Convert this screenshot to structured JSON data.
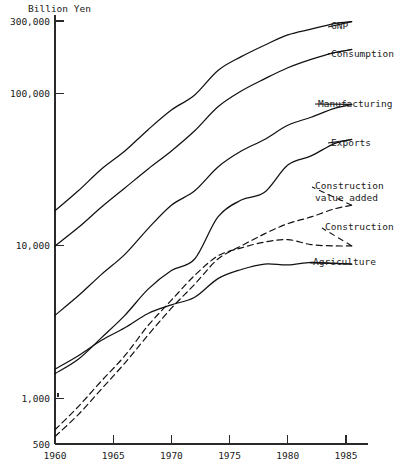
{
  "chart_data": {
    "type": "line",
    "title": "",
    "unit_label": "Billion Yen",
    "xlabel": "",
    "ylabel": "Billion Yen",
    "yscale": "log",
    "ylim": [
      500,
      300000
    ],
    "xlim": [
      1960,
      1985.7
    ],
    "grid": false,
    "legend_position": "right-inline-labels",
    "ytick_labels": [
      "300,000",
      "100,000",
      "10,000",
      "1,000",
      "500"
    ],
    "ytick_values": [
      300000,
      100000,
      10000,
      1000,
      500
    ],
    "xtick_labels": [
      "1960",
      "1965",
      "1970",
      "1975",
      "1980",
      "1985"
    ],
    "xtick_values": [
      1960,
      1965,
      1970,
      1975,
      1980,
      1985
    ],
    "series": [
      {
        "name": "GNP",
        "style": "solid",
        "label": "GNP",
        "x": [
          1960,
          1962,
          1964,
          1966,
          1968,
          1970,
          1972,
          1974,
          1976,
          1978,
          1980,
          1982,
          1984,
          1985.5
        ],
        "values": [
          17000,
          23000,
          32000,
          42000,
          58000,
          78000,
          98000,
          142000,
          175000,
          208000,
          243000,
          265000,
          288000,
          297000
        ]
      },
      {
        "name": "Consumption",
        "style": "solid",
        "label": "Consumption",
        "x": [
          1960,
          1962,
          1964,
          1966,
          1968,
          1970,
          1972,
          1974,
          1976,
          1978,
          1980,
          1982,
          1984,
          1985.5
        ],
        "values": [
          10000,
          13200,
          18000,
          24000,
          32000,
          42000,
          57000,
          82000,
          104000,
          125000,
          148000,
          168000,
          186000,
          195000
        ]
      },
      {
        "name": "Manufacturing",
        "style": "solid",
        "label": "Manufacturing",
        "x": [
          1960,
          1962,
          1964,
          1966,
          1968,
          1970,
          1972,
          1974,
          1976,
          1978,
          1980,
          1982,
          1984,
          1985.5
        ],
        "values": [
          3500,
          4700,
          6500,
          8800,
          13000,
          18500,
          23000,
          33000,
          42000,
          50000,
          62000,
          70000,
          80000,
          85000
        ]
      },
      {
        "name": "Exports",
        "style": "solid",
        "label": "Exports",
        "x": [
          1960,
          1962,
          1964,
          1966,
          1968,
          1970,
          1972,
          1974,
          1976,
          1978,
          1980,
          1982,
          1984,
          1985.5
        ],
        "values": [
          1450,
          1800,
          2500,
          3500,
          5200,
          6900,
          8200,
          15500,
          20000,
          22500,
          34000,
          39000,
          47000,
          50000
        ]
      },
      {
        "name": "Construction value added",
        "style": "dashed",
        "label": "Construction value added",
        "label_line2": "value added",
        "x": [
          1960,
          1962,
          1964,
          1966,
          1968,
          1970,
          1972,
          1974,
          1976,
          1978,
          1980,
          1982,
          1984,
          1985.5
        ],
        "values": [
          560,
          780,
          1150,
          1700,
          2600,
          3900,
          5600,
          8200,
          10000,
          12000,
          14000,
          15500,
          17500,
          18500
        ]
      },
      {
        "name": "Construction",
        "style": "dashed",
        "label": "Construction",
        "x": [
          1960,
          1962,
          1964,
          1966,
          1968,
          1970,
          1972,
          1974,
          1976,
          1978,
          1980,
          1982,
          1984,
          1985.5
        ],
        "values": [
          620,
          880,
          1300,
          1900,
          3000,
          4400,
          6400,
          8600,
          9700,
          10600,
          11000,
          10200,
          10000,
          10000
        ]
      },
      {
        "name": "Agriculture",
        "style": "solid",
        "label": "Agriculture",
        "x": [
          1960,
          1962,
          1964,
          1966,
          1968,
          1970,
          1972,
          1974,
          1976,
          1978,
          1980,
          1982,
          1984,
          1985.5
        ],
        "values": [
          1550,
          1900,
          2400,
          2900,
          3600,
          4100,
          4600,
          6100,
          7000,
          7600,
          7500,
          7800,
          7700,
          7600
        ]
      }
    ],
    "series_labels": [
      {
        "name": "GNP",
        "text": "GNP",
        "x": 331,
        "y": 29
      },
      {
        "name": "Consumption",
        "text": "Consumption",
        "x": 331,
        "y": 57
      },
      {
        "name": "Manufacturing",
        "text": "Manufacturing",
        "x": 318,
        "y": 107
      },
      {
        "name": "Exports",
        "text": "Exports",
        "x": 331,
        "y": 146
      },
      {
        "name": "Construction value added line 1",
        "text": "Construction",
        "x": 315,
        "y": 189
      },
      {
        "name": "Construction value added line 2",
        "text": "value added",
        "x": 315,
        "y": 201
      },
      {
        "name": "Construction",
        "text": "Construction",
        "x": 325,
        "y": 230
      },
      {
        "name": "Agriculture",
        "text": "Agriculture",
        "x": 313,
        "y": 265
      }
    ],
    "colors": {
      "line": "#111111",
      "axis": "#2a2a2a",
      "text": "#1a1a1a",
      "background": "#ffffff"
    }
  }
}
